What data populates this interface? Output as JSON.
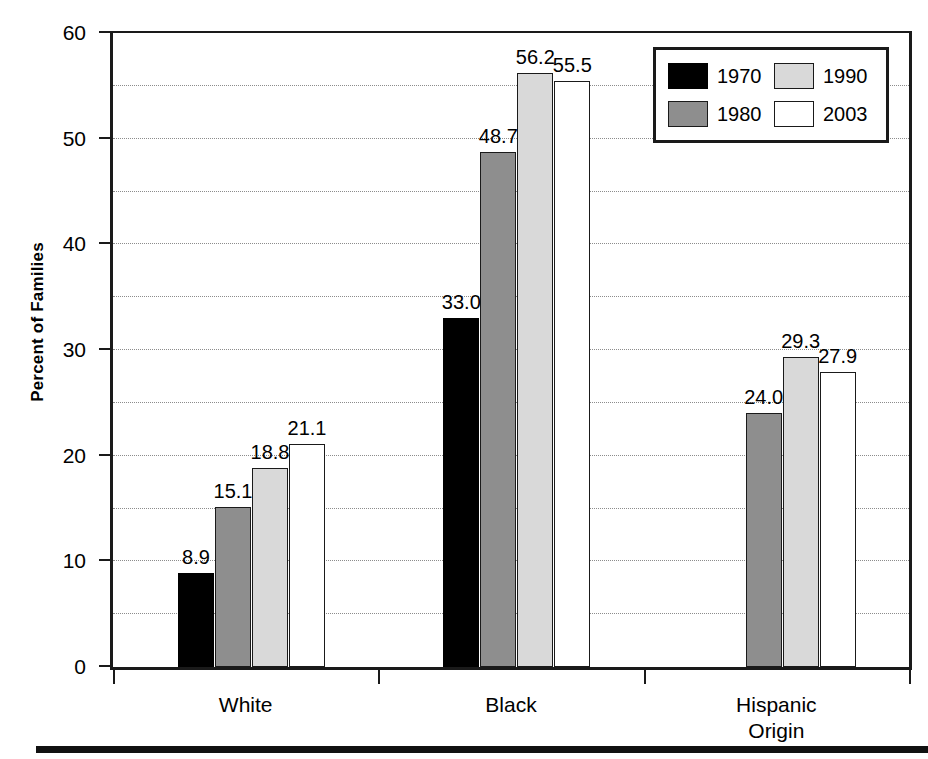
{
  "chart_data": {
    "type": "bar",
    "title": "",
    "subtitle": "",
    "xlabel": "",
    "ylabel": "Percent of Families",
    "categories": [
      "White",
      "Black",
      "Hispanic\nOrigin"
    ],
    "series": [
      {
        "name": "1970",
        "color": "#000000",
        "values": [
          8.9,
          33.0,
          null
        ]
      },
      {
        "name": "1980",
        "color": "#8e8e8e",
        "values": [
          15.1,
          48.7,
          24.0
        ]
      },
      {
        "name": "1990",
        "color": "#d9d9d9",
        "values": [
          18.8,
          56.2,
          29.3
        ]
      },
      {
        "name": "2003",
        "color": "#ffffff",
        "values": [
          21.1,
          55.5,
          27.9
        ]
      }
    ],
    "value_labels": [
      [
        "8.9",
        "33.0",
        ""
      ],
      [
        "15.1",
        "48.7",
        "24.0"
      ],
      [
        "18.8",
        "56.2",
        "29.3"
      ],
      [
        "21.1",
        "55.5",
        "27.9"
      ]
    ],
    "ylim": [
      0,
      60
    ],
    "ytick_values": [
      0,
      10,
      20,
      30,
      40,
      50,
      60
    ],
    "ytick_labels": [
      "0",
      "10",
      "20",
      "30",
      "40",
      "50",
      "60"
    ],
    "gridline_values": [
      5,
      10,
      15,
      20,
      25,
      30,
      35,
      40,
      45,
      50,
      55
    ],
    "grid": true,
    "grid_style": "dotted",
    "legend_position": "top-right",
    "legend_layout": "2x2",
    "legend_entries": [
      "1970",
      "1990",
      "1980",
      "2003"
    ]
  },
  "axis": {
    "y_title": "Percent of Families"
  },
  "legend": {
    "entries": [
      {
        "label": "1970",
        "swatch": "s0"
      },
      {
        "label": "1990",
        "swatch": "s2"
      },
      {
        "label": "1980",
        "swatch": "s1"
      },
      {
        "label": "2003",
        "swatch": "s3"
      }
    ]
  }
}
